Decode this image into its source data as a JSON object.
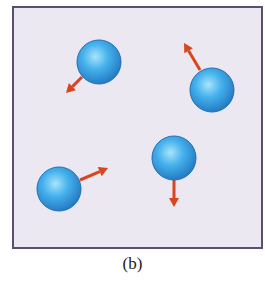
{
  "caption": "(b)",
  "colors": {
    "box_fill": "#ece8f1",
    "box_border": "#5b4f70",
    "sphere_light": "#9fe0fb",
    "sphere_mid": "#3aa6e6",
    "sphere_dark": "#1f6fb5",
    "arrow": "#d9461e"
  },
  "box": {
    "x": 13,
    "y": 7,
    "width": 249,
    "height": 241
  },
  "particles": [
    {
      "id": 1,
      "cx": 99,
      "cy": 62,
      "r": 22,
      "arrow": {
        "x1": 82,
        "y1": 77,
        "x2": 66,
        "y2": 93
      }
    },
    {
      "id": 2,
      "cx": 212,
      "cy": 90,
      "r": 22,
      "arrow": {
        "x1": 200,
        "y1": 70,
        "x2": 184,
        "y2": 43
      }
    },
    {
      "id": 3,
      "cx": 174,
      "cy": 158,
      "r": 22,
      "arrow": {
        "x1": 174,
        "y1": 180,
        "x2": 174,
        "y2": 207
      }
    },
    {
      "id": 4,
      "cx": 59,
      "cy": 189,
      "r": 22,
      "arrow": {
        "x1": 80,
        "y1": 180,
        "x2": 108,
        "y2": 168
      }
    }
  ]
}
